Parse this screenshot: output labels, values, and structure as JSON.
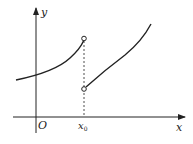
{
  "diagram": {
    "type": "function-graph-jump-discontinuity",
    "axes": {
      "x_label": "x",
      "y_label": "y",
      "origin_label": "O"
    },
    "discontinuity": {
      "x_label": "x",
      "x_subscript": "0",
      "left_limit_point": "open-circle",
      "right_limit_point": "open-circle"
    },
    "colors": {
      "stroke": "#222222",
      "background": "#ffffff"
    }
  }
}
